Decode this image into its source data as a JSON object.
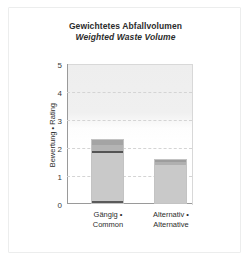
{
  "card": {
    "background": "#ffffff",
    "border_color": "#eceded"
  },
  "chart_data": {
    "type": "bar",
    "title": "Gewichtetes Abfallvolumen",
    "subtitle": "Weighted Waste Volume",
    "xlabel": "",
    "ylabel": "Bewertung • Rating",
    "ylim": [
      0,
      5
    ],
    "yticks": [
      0,
      1,
      2,
      3,
      4,
      5
    ],
    "ytick_labels": [
      "0",
      "1",
      "2",
      "3",
      "4",
      "5"
    ],
    "grid": true,
    "grid_axis": "y",
    "legend": "none",
    "stacked": true,
    "categories": [
      "Gängig • Common",
      "Alternativ • Alternative"
    ],
    "category_lines": [
      [
        "Gängig •",
        "Common"
      ],
      [
        "Alternativ •",
        "Alternative"
      ]
    ],
    "values": [
      2.32,
      1.6
    ],
    "series": [
      {
        "name": "segment-base",
        "values": [
          0.08,
          0.0
        ],
        "color": "#5a5a5a"
      },
      {
        "name": "segment-body",
        "values": [
          1.7,
          1.35
        ],
        "color": "#c8c8c8"
      },
      {
        "name": "segment-divider",
        "values": [
          0.07,
          0.0
        ],
        "color": "#545454"
      },
      {
        "name": "segment-top",
        "values": [
          0.47,
          0.25
        ],
        "color": "#a8a8a8"
      }
    ],
    "bars": [
      {
        "category": "Gängig • Common",
        "total": 2.32,
        "segments": [
          {
            "name": "base-dark",
            "from": 0.0,
            "to": 0.08,
            "color": "#5a5a5a"
          },
          {
            "name": "lower-body",
            "from": 0.08,
            "to": 1.78,
            "color": "#c9c9c9"
          },
          {
            "name": "mid-divider",
            "from": 1.78,
            "to": 1.85,
            "color": "#545454"
          },
          {
            "name": "upper-body",
            "from": 1.85,
            "to": 2.06,
            "color": "#b4b4b4"
          },
          {
            "name": "top-cap",
            "from": 2.06,
            "to": 2.32,
            "color": "#a4a4a4"
          }
        ]
      },
      {
        "category": "Alternativ • Alternative",
        "total": 1.6,
        "segments": [
          {
            "name": "lower-body",
            "from": 0.0,
            "to": 1.35,
            "color": "#c9c9c9"
          },
          {
            "name": "upper-body",
            "from": 1.35,
            "to": 1.46,
            "color": "#b0b0b0"
          },
          {
            "name": "top-cap",
            "from": 1.46,
            "to": 1.6,
            "color": "#9d9d9d"
          }
        ]
      }
    ],
    "plot_bg_top_color": "#eeeeee",
    "plot_bg_bottom_color": "#ffffff",
    "gridline_color": "#d4d4d4",
    "axis_color": "#9a9a9a",
    "bar_border_color": "#c3c3c3"
  }
}
